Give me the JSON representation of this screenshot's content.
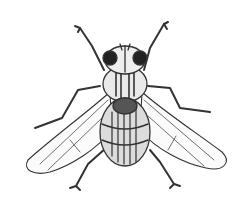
{
  "image": {
    "subject": "fly",
    "style": "black-and-white engraving illustration",
    "background": "#ffffff",
    "ink": "#2a2a2a"
  }
}
